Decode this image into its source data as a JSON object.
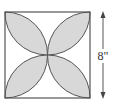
{
  "diagram": {
    "shape": "square with four quarter-circle-arc petals (four-leaf pattern)",
    "dimension_label": "8\"",
    "colors": {
      "petal_fill": "#d8d8d8",
      "stroke": "#555555",
      "background": "#ffffff"
    }
  }
}
